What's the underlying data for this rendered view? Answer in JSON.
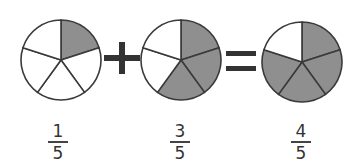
{
  "colors": {
    "shaded": "#8f8f8f",
    "unshaded": "#ffffff",
    "stroke": "#3a3a3a",
    "operator": "#333333"
  },
  "equation": {
    "operator_plus": "+",
    "operator_equals": "="
  },
  "pies": [
    {
      "name": "pie-one-fifth",
      "cx": 61,
      "cy": 60,
      "r": 40,
      "slices": 5,
      "shaded": 1
    },
    {
      "name": "pie-three-fifths",
      "cx": 181,
      "cy": 60,
      "r": 40,
      "slices": 5,
      "shaded": 3
    },
    {
      "name": "pie-four-fifths",
      "cx": 302,
      "cy": 62,
      "r": 40,
      "slices": 5,
      "shaded": 4
    }
  ],
  "fractions": [
    {
      "numerator": "1",
      "denominator": "5"
    },
    {
      "numerator": "3",
      "denominator": "5"
    },
    {
      "numerator": "4",
      "denominator": "5"
    }
  ]
}
